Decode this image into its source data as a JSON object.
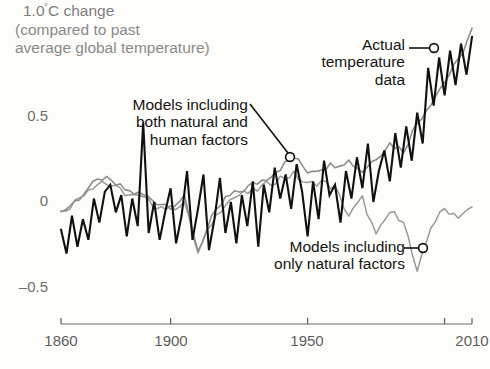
{
  "figure": {
    "axis_title": "1.0",
    "axis_title_degree": "˚",
    "axis_title_unit": "C change",
    "axis_subtitle": "(compared to past\naverage global temperature)",
    "background_color": "#fdfdfa"
  },
  "callouts": {
    "actual": "Actual\ntemperature\ndata",
    "both_factors": "Models including\nboth natural and\nhuman factors",
    "natural_only": "Models including\nonly natural factors"
  },
  "chart_data": {
    "type": "line",
    "title": "1.0˚C change (compared to past average global temperature)",
    "xlabel": "",
    "ylabel": "˚C change compared to past average global temperature",
    "xlim": [
      1860,
      2010
    ],
    "ylim": [
      -0.62,
      1.05
    ],
    "xticks": [
      1860,
      1900,
      1950,
      2010
    ],
    "xtick_labels": [
      "1860",
      "1900",
      "1950",
      "2010"
    ],
    "minor_xticks": [
      2000
    ],
    "yticks": [
      0.5,
      0,
      -0.5
    ],
    "ytick_labels": [
      "0.5",
      "0",
      "–0.5"
    ],
    "grid": false,
    "legend": "annotations",
    "colors": {
      "observed": "#111111",
      "natural_and_human": "#8d8d8d",
      "natural_only": "#9a9a9a",
      "axis": "#6a6a6a",
      "title_text": "#7e7e7e"
    },
    "annotations": [
      {
        "label": "Actual temperature data",
        "series": "observed",
        "point": [
          1994,
          0.78
        ]
      },
      {
        "label": "Models including both natural and human factors",
        "series": "natural_and_human",
        "point": [
          1943,
          0.26
        ]
      },
      {
        "label": "Models including only natural factors",
        "series": "natural_only",
        "point": [
          1990,
          -0.27
        ]
      }
    ],
    "series": [
      {
        "name": "Actual temperature data",
        "key": "observed",
        "color": "#111111",
        "x": [
          1860,
          1862,
          1864,
          1866,
          1868,
          1870,
          1872,
          1874,
          1876,
          1878,
          1880,
          1882,
          1884,
          1886,
          1888,
          1890,
          1892,
          1894,
          1896,
          1898,
          1900,
          1902,
          1904,
          1906,
          1908,
          1910,
          1912,
          1914,
          1916,
          1918,
          1920,
          1922,
          1924,
          1926,
          1928,
          1930,
          1932,
          1934,
          1936,
          1938,
          1940,
          1942,
          1944,
          1946,
          1948,
          1950,
          1952,
          1954,
          1956,
          1958,
          1960,
          1962,
          1964,
          1966,
          1968,
          1970,
          1972,
          1974,
          1976,
          1978,
          1980,
          1982,
          1984,
          1986,
          1988,
          1990,
          1992,
          1994,
          1996,
          1998,
          2000,
          2002,
          2004,
          2006,
          2008,
          2010
        ],
        "y": [
          -0.16,
          -0.3,
          -0.08,
          -0.26,
          -0.1,
          -0.22,
          0.02,
          -0.12,
          0.06,
          0.1,
          -0.06,
          0.04,
          -0.2,
          0.02,
          -0.14,
          0.46,
          -0.18,
          0.0,
          -0.22,
          -0.06,
          0.08,
          -0.24,
          -0.08,
          0.18,
          -0.22,
          -0.04,
          0.16,
          -0.28,
          -0.1,
          0.14,
          -0.18,
          0.0,
          -0.24,
          0.04,
          -0.14,
          0.12,
          -0.26,
          0.1,
          -0.06,
          0.2,
          0.02,
          0.16,
          -0.04,
          0.22,
          0.06,
          -0.2,
          0.12,
          -0.1,
          0.24,
          0.04,
          0.1,
          -0.12,
          0.18,
          0.02,
          0.26,
          0.08,
          0.34,
          0.0,
          0.18,
          0.3,
          0.12,
          0.4,
          0.2,
          0.44,
          0.24,
          0.52,
          0.34,
          0.78,
          0.56,
          0.84,
          0.62,
          0.88,
          0.68,
          0.92,
          0.74,
          0.96
        ]
      },
      {
        "name": "Models including both natural and human factors",
        "key": "natural_and_human",
        "color": "#8d8d8d",
        "x": [
          1860,
          1865,
          1870,
          1875,
          1880,
          1885,
          1890,
          1895,
          1900,
          1905,
          1910,
          1915,
          1920,
          1925,
          1930,
          1935,
          1940,
          1945,
          1950,
          1955,
          1960,
          1965,
          1970,
          1975,
          1980,
          1985,
          1990,
          1995,
          2000,
          2005,
          2010
        ],
        "y": [
          -0.06,
          0.0,
          0.08,
          0.14,
          0.1,
          0.06,
          0.04,
          0.0,
          -0.02,
          0.02,
          -0.28,
          -0.1,
          0.02,
          0.06,
          0.1,
          0.14,
          0.2,
          0.26,
          0.18,
          0.2,
          0.22,
          0.24,
          0.18,
          0.26,
          0.34,
          0.3,
          0.46,
          0.58,
          0.7,
          0.82,
          1.0
        ]
      },
      {
        "name": "Models including only natural factors",
        "key": "natural_only",
        "color": "#9a9a9a",
        "x": [
          1860,
          1865,
          1870,
          1875,
          1880,
          1885,
          1890,
          1895,
          1900,
          1905,
          1910,
          1915,
          1920,
          1925,
          1930,
          1935,
          1940,
          1945,
          1950,
          1955,
          1960,
          1965,
          1970,
          1975,
          1980,
          1985,
          1990,
          1995,
          2000,
          2005,
          2010
        ],
        "y": [
          -0.06,
          0.0,
          0.08,
          0.12,
          0.08,
          0.04,
          0.02,
          -0.02,
          -0.04,
          0.0,
          -0.3,
          -0.12,
          0.0,
          0.04,
          0.06,
          0.1,
          0.14,
          0.16,
          0.1,
          0.12,
          0.08,
          -0.08,
          0.02,
          -0.2,
          -0.06,
          -0.1,
          -0.42,
          -0.14,
          -0.04,
          -0.08,
          -0.04
        ]
      }
    ]
  }
}
